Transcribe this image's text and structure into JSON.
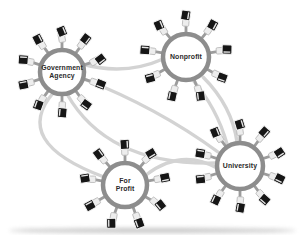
{
  "colors": {
    "background": "#ffffff",
    "edge": "#d3d3d3",
    "ring": "#8d8d8d",
    "hub_fill": "#ffffff",
    "spoke": "#9c9c9c",
    "monitor": "#161616",
    "monitor_rim": "#f4f4f4",
    "screen_line": "#fdfdfd",
    "keyboard": "#ededed",
    "keyboard_stroke": "#b5b5b5",
    "label": "#2a2a2a",
    "page_shadow": "#9a9a9a"
  },
  "diagram": {
    "width": 303,
    "height": 235,
    "hubs": [
      {
        "id": "government-agency",
        "lines": [
          "Government",
          "Agency"
        ],
        "x": 62,
        "y": 72,
        "r": 22,
        "spokes": 10,
        "start_angle": -90
      },
      {
        "id": "nonprofit",
        "lines": [
          "Nonprofit"
        ],
        "x": 186,
        "y": 57,
        "r": 23,
        "spokes": 9,
        "start_angle": -90
      },
      {
        "id": "for-profit",
        "lines": [
          "For",
          "Profit"
        ],
        "x": 125,
        "y": 185,
        "r": 22,
        "spokes": 9,
        "start_angle": -90
      },
      {
        "id": "university",
        "lines": [
          "University"
        ],
        "x": 240,
        "y": 166,
        "r": 23,
        "spokes": 10,
        "start_angle": -90
      }
    ],
    "edges": [
      {
        "from": "government-agency",
        "to": "nonprofit",
        "path": [
          [
            82,
            64
          ],
          [
            125,
            76
          ],
          [
            163,
            59
          ]
        ]
      },
      {
        "from": "government-agency",
        "to": "university",
        "path": [
          [
            84,
            79
          ],
          [
            158,
            108
          ],
          [
            218,
            152
          ]
        ]
      },
      {
        "from": "government-agency",
        "to": "university",
        "path": [
          [
            67,
            94
          ],
          [
            108,
            166
          ],
          [
            216,
            163
          ]
        ]
      },
      {
        "from": "government-agency",
        "to": "for-profit",
        "path": [
          [
            54,
            92
          ],
          [
            10,
            142
          ],
          [
            104,
            177
          ]
        ]
      },
      {
        "from": "nonprofit",
        "to": "university",
        "path": [
          [
            192,
            79
          ],
          [
            217,
            108
          ],
          [
            227,
            144
          ]
        ]
      },
      {
        "from": "nonprofit",
        "to": "university",
        "path": [
          [
            203,
            77
          ],
          [
            232,
            106
          ],
          [
            237,
            142
          ]
        ]
      },
      {
        "from": "for-profit",
        "to": "university",
        "path": [
          [
            146,
            175
          ],
          [
            181,
            148
          ],
          [
            217,
            168
          ]
        ]
      }
    ]
  }
}
